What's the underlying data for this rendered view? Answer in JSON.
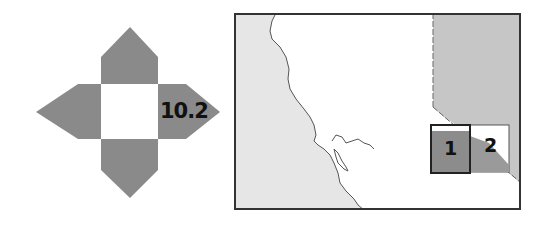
{
  "locator_icon": {
    "label": "10.2",
    "arm_color": "#8a8a8a",
    "center_color": "#ffffff"
  },
  "map": {
    "ocean_color": "#e6e6e6",
    "land_color": "#ffffff",
    "neighbor_state_color": "#c6c6c6",
    "frame_color": "#333333",
    "inset_boxes": [
      {
        "label": "1",
        "fill": "#8c8c8c",
        "highlighted": true
      },
      {
        "label": "2",
        "fill": "#9a9a9a",
        "highlighted": false
      }
    ]
  }
}
